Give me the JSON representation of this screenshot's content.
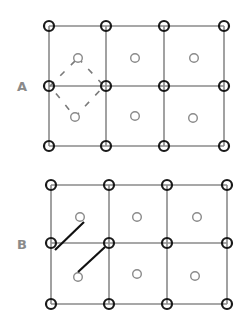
{
  "colors": {
    "grid_line": "#8a8a8a",
    "corner_node": "#1a1a1a",
    "center_node": "#8a8a8a",
    "bond_line": "#111111",
    "dashed": "#7a7a7a",
    "label": "#8a8a8a"
  },
  "panels": [
    {
      "label": "A",
      "label_pos": [
        17,
        91
      ],
      "cols": [
        49,
        106,
        164,
        224
      ],
      "rows": [
        26,
        86,
        146
      ],
      "centers": [
        [
          78,
          58
        ],
        [
          135,
          58
        ],
        [
          194,
          58
        ],
        [
          75,
          117
        ],
        [
          135,
          116
        ],
        [
          193,
          118
        ]
      ],
      "dashed_diamond": [
        [
          78,
          58
        ],
        [
          104,
          86
        ],
        [
          75,
          117
        ],
        [
          50,
          86
        ]
      ],
      "bonds": []
    },
    {
      "label": "B",
      "label_pos": [
        17,
        249
      ],
      "cols": [
        51,
        109,
        167,
        227
      ],
      "rows": [
        185,
        243,
        304
      ],
      "centers": [
        [
          80,
          217
        ],
        [
          137,
          217
        ],
        [
          197,
          217
        ],
        [
          78,
          277
        ],
        [
          137,
          274
        ],
        [
          195,
          276
        ]
      ],
      "dashed_diamond": [],
      "bonds": [
        [
          [
            84,
            222
          ],
          [
            55,
            250
          ]
        ],
        [
          [
            105,
            247
          ],
          [
            78,
            272
          ]
        ]
      ]
    }
  ]
}
